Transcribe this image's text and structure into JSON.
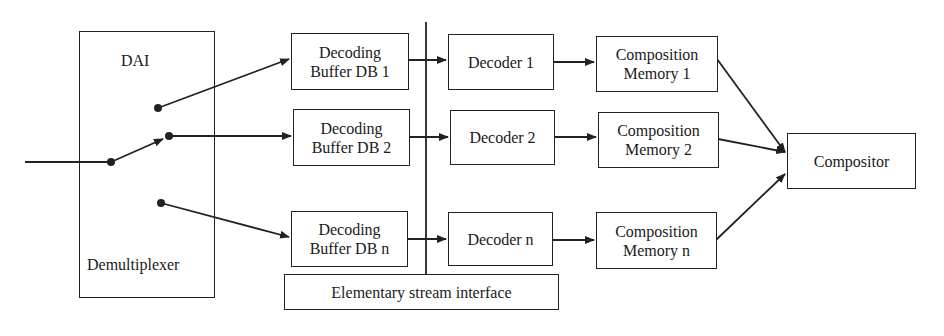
{
  "diagram": {
    "demultiplexer": {
      "top_label": "DAI",
      "bottom_label": "Demultiplexer"
    },
    "decoding_buffers": [
      {
        "line1": "Decoding",
        "line2": "Buffer DB 1"
      },
      {
        "line1": "Decoding",
        "line2": "Buffer DB 2"
      },
      {
        "line1": "Decoding",
        "line2": "Buffer DB n"
      }
    ],
    "decoders": [
      {
        "label": "Decoder 1"
      },
      {
        "label": "Decoder 2"
      },
      {
        "label": "Decoder n"
      }
    ],
    "composition_memories": [
      {
        "line1": "Composition",
        "line2": "Memory 1"
      },
      {
        "line1": "Composition",
        "line2": "Memory 2"
      },
      {
        "line1": "Composition",
        "line2": "Memory n"
      }
    ],
    "compositor": {
      "label": "Compositor"
    },
    "es_interface": {
      "label": "Elementary stream interface"
    },
    "colors": {
      "stroke": "#222222",
      "background": "#ffffff"
    }
  }
}
